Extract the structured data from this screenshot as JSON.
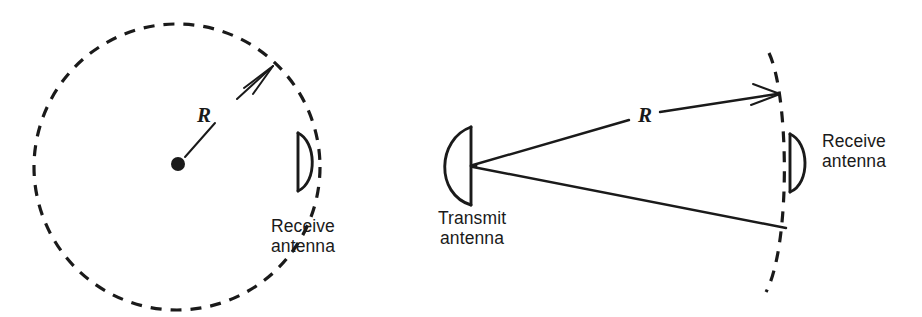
{
  "figure": {
    "background_color": "#ffffff",
    "ink_color": "#1a1a1a",
    "width": 922,
    "height": 317,
    "caption": ""
  },
  "panels": [
    {
      "id": "omnidirectional-panel",
      "name": "omnidirectional-coverage-diagram",
      "range_label": "R",
      "receive_antenna_label_line1": "Receive",
      "receive_antenna_label_line2": "antenna",
      "geometry": {
        "circle_center_x": 177,
        "circle_center_y": 167,
        "circle_radius": 143,
        "dash_pattern": "11 9",
        "source_dot_x": 178,
        "source_dot_y": 164,
        "source_dot_radius": 7,
        "radius_line_start_x": 186,
        "radius_line_start_y": 156,
        "radius_line_break_x": 214,
        "radius_line_break_y": 124,
        "radius_line_resume_x": 236,
        "radius_line_resume_y": 100,
        "arrow_tip_x": 273,
        "arrow_tip_y": 66,
        "r_label_x": 204,
        "r_label_y": 121,
        "dish_flat_x": 298,
        "dish_top_y": 133,
        "dish_bottom_y": 191,
        "dish_bulge_x": 314,
        "label_x": 303,
        "label_y": 232
      }
    },
    {
      "id": "directional-panel",
      "name": "directional-beam-diagram",
      "range_label": "R",
      "transmit_antenna_label_line1": "Transmit",
      "transmit_antenna_label_line2": "antenna",
      "receive_antenna_label_line1": "Receive",
      "receive_antenna_label_line2": "antenna",
      "geometry": {
        "tx_feed_x": 472,
        "tx_feed_y": 166,
        "tx_flat_x": 471,
        "tx_top_y": 127,
        "tx_bottom_y": 205,
        "tx_bulge_x": 438,
        "tx_label_x": 472,
        "tx_label_y": 224,
        "upper_ray_break_start_x": 628,
        "upper_ray_break_start_y": 120,
        "upper_ray_break_end_x": 659,
        "upper_ray_break_end_y": 112,
        "upper_arrow_tip_x": 779,
        "upper_arrow_tip_y": 94,
        "lower_ray_end_x": 786,
        "lower_ray_end_y": 228,
        "r_label_x": 637,
        "r_label_y": 122,
        "arc_top_x": 769,
        "arc_top_y": 53,
        "arc_mid_x": 794,
        "arc_mid_y": 170,
        "arc_bottom_x": 766,
        "arc_bottom_y": 292,
        "dash_pattern": "11 9",
        "rx_flat_x": 790,
        "rx_top_y": 134,
        "rx_bottom_y": 192,
        "rx_bulge_x": 808,
        "rx_label_x": 822,
        "rx_label_y": 147
      }
    }
  ]
}
